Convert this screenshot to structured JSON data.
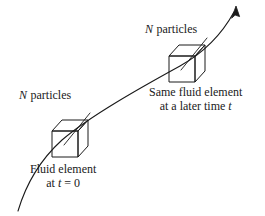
{
  "figure": {
    "name": "fluid-element-trajectory-diagram",
    "background_color": "#ffffff",
    "stroke_color": "#1a1a1a",
    "width": 265,
    "height": 216
  },
  "labels": {
    "n_particles_top": {
      "symbol": "N",
      "text": "particles",
      "full": "N particles"
    },
    "n_particles_bottom": {
      "symbol": "N",
      "text": "particles",
      "full": "N particles"
    },
    "later_element": {
      "line1": "Same fluid element",
      "line2_prefix": "at a later time ",
      "line2_symbol": "t",
      "full": "Same fluid element at a later time t"
    },
    "initial_element": {
      "line1": "Fluid element",
      "line2_prefix": "at ",
      "line2_symbol": "t",
      "line2_suffix": " = 0",
      "full": "Fluid element at t = 0"
    }
  },
  "graphics": {
    "trajectory": {
      "name": "trajectory-curve",
      "has_arrowhead": true,
      "arrow_tip": [
        236,
        7
      ],
      "start": [
        18,
        211
      ]
    },
    "cube_initial": {
      "name": "fluid-element-cube-initial",
      "front_face": [
        [
          52,
          131
        ],
        [
          52,
          157
        ],
        [
          78,
          157
        ],
        [
          78,
          131
        ]
      ],
      "depth_offset": [
        10,
        -11
      ]
    },
    "cube_later": {
      "name": "fluid-element-cube-later",
      "front_face": [
        [
          169,
          56
        ],
        [
          169,
          82
        ],
        [
          195,
          82
        ],
        [
          195,
          56
        ]
      ],
      "depth_offset": [
        10,
        -11
      ]
    },
    "leader_initial": {
      "name": "leader-line-initial",
      "from": [
        89,
        115
      ],
      "to": [
        66,
        143
      ]
    },
    "leader_later": {
      "name": "leader-line-later",
      "from": [
        206,
        40
      ],
      "to": [
        183,
        68
      ]
    }
  }
}
